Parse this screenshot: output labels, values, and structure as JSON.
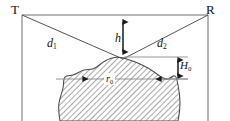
{
  "figure": {
    "background_color": "#ffffff",
    "line_color": "#555555",
    "text_color": "#111111",
    "hatch_color": "#666666",
    "terminals": {
      "transmitter_label": "T",
      "receiver_label": "R"
    },
    "paths": {
      "left_path_label": "d",
      "left_path_sub": "1",
      "right_path_label": "d",
      "right_path_sub": "2"
    },
    "clearance": {
      "label": "h",
      "arrow": "double-headed-vertical"
    },
    "obstacle_height": {
      "label": "H",
      "sub": "0",
      "arrow": "double-headed-vertical"
    },
    "obstacle_radius": {
      "label": "r",
      "sub": "0",
      "arrow": "double-headed-horizontal"
    },
    "obstacle": {
      "name": "hill",
      "fill": "diagonal-hatching"
    }
  }
}
